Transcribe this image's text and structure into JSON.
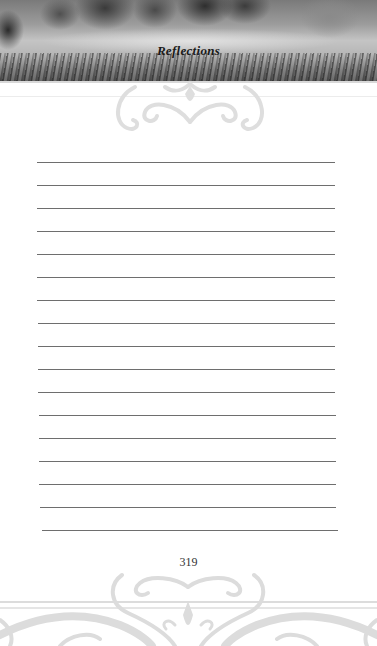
{
  "header": {
    "title": "Reflections",
    "image_description": "grayscale meadow of poppies and grass"
  },
  "writing_area": {
    "line_count": 17,
    "first_line_y": 162,
    "line_spacing": 23,
    "line_start_x": 37,
    "line_end_x": 335,
    "line_color": "#6e6e6e"
  },
  "footer": {
    "page_number": "319"
  },
  "colors": {
    "background": "#ffffff",
    "ornament": "#dcdcdc",
    "title": "#1a1a1a"
  }
}
